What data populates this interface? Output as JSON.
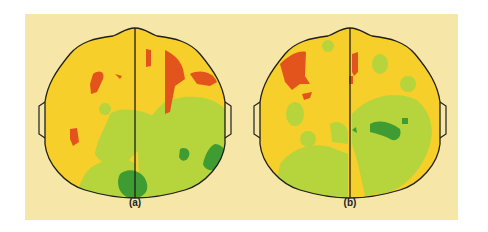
{
  "figures": [
    {
      "id": "a",
      "caption": "(a)",
      "description": "Top-down brain activity map of head, left and right hemispheres",
      "colors": {
        "high": "#e2541c",
        "mid_high": "#f7cf2a",
        "mid_low": "#b6d43c",
        "low": "#3f9c32"
      }
    },
    {
      "id": "b",
      "caption": "(b)",
      "description": "Top-down brain activity map of head, left and right hemispheres",
      "colors": {
        "high": "#e2541c",
        "mid_high": "#f7cf2a",
        "mid_low": "#b6d43c",
        "low": "#3f9c32"
      }
    }
  ],
  "palette": {
    "panel_bg": "#f6e7a8",
    "outline": "#1e1e1e",
    "red": "#e2541c",
    "yellow": "#f7cf2a",
    "light_green": "#b6d43c",
    "dark_green": "#3f9c32"
  }
}
